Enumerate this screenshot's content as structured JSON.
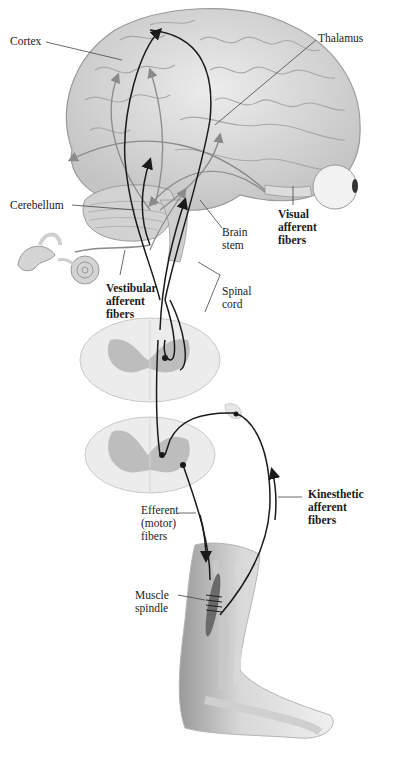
{
  "diagram": {
    "labels": {
      "cortex": "Cortex",
      "thalamus": "Thalamus",
      "cerebellum": "Cerebellum",
      "brain_stem": "Brain\nstem",
      "visual_afferent": "Visual\nafferent\nfibers",
      "vestibular_afferent": "Vestibular\nafferent\nfibers",
      "spinal_cord": "Spinal\ncord",
      "kinesthetic_afferent": "Kinesthetic\nafferent\nfibers",
      "efferent_motor": "Efferent\n(motor)\nfibers",
      "muscle_spindle": "Muscle\nspindle"
    },
    "structures": [
      "brain",
      "cerebellum",
      "brain-stem",
      "eye",
      "inner-ear",
      "spinal-cord-section-upper",
      "spinal-cord-section-lower",
      "leg",
      "foot",
      "muscle-spindle"
    ],
    "colors": {
      "brain_fill": "#d9d9d9",
      "tissue_light": "#ececec",
      "gray_matter": "#bdbdbd",
      "pathway_dark": "#1a1a1a",
      "pathway_light": "#8a8a8a",
      "label_line": "#444444"
    }
  }
}
